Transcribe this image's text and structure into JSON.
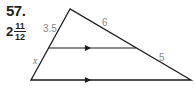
{
  "problem": {
    "number": "57.",
    "answer": {
      "whole": "2",
      "numerator": "11",
      "denominator": "12"
    }
  },
  "diagram": {
    "type": "triangle-with-parallel-segment",
    "labels": {
      "upper_left_segment": "3.5",
      "lower_left_segment": "x",
      "upper_right_segment": "6",
      "lower_right_segment": "5"
    },
    "colors": {
      "stroke": "#1a1a1a",
      "label": "#8a8a8a"
    }
  }
}
